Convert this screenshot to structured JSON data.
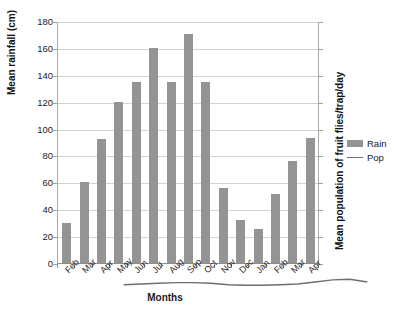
{
  "chart_data": {
    "type": "bar",
    "title": "",
    "subtitle": "",
    "xlabel": "Months",
    "ylabel": "Mean rainfall (cm)",
    "y2label": "Mean population of fruit flies/trap/day",
    "categories": [
      "Feb",
      "Mar",
      "Apr",
      "May",
      "Jun",
      "Jul",
      "Aug",
      "Sep",
      "Oct",
      "Nov",
      "Dec",
      "Jan",
      "Feb",
      "Mar",
      "Apr"
    ],
    "ylim": [
      0,
      180
    ],
    "yticks": [
      0,
      20,
      40,
      60,
      80,
      100,
      120,
      140,
      160,
      180
    ],
    "ytick_labels": [
      "0",
      "20",
      "40",
      "60",
      "80",
      "100",
      "120",
      "140",
      "160",
      "180"
    ],
    "grid": true,
    "grid_axis": "y",
    "legend_position": "right",
    "series": [
      {
        "name": "Rain",
        "type": "bar",
        "axis": "left",
        "color": "#949494",
        "values": [
          30,
          60,
          92,
          120,
          135,
          160,
          135,
          170,
          135,
          56,
          32,
          25,
          51,
          76,
          93
        ]
      },
      {
        "name": "Pop",
        "type": "line",
        "axis": "right",
        "color": "#6f6f6f",
        "values": [
          1,
          1.5,
          2,
          2.5,
          2.5,
          2,
          1,
          0.5,
          0.5,
          1,
          1.5,
          3,
          4.5,
          5,
          3
        ]
      }
    ]
  },
  "legend": {
    "items": [
      {
        "label": "Rain",
        "marker": "bar-swatch"
      },
      {
        "label": "Pop",
        "marker": "line-swatch"
      }
    ]
  }
}
